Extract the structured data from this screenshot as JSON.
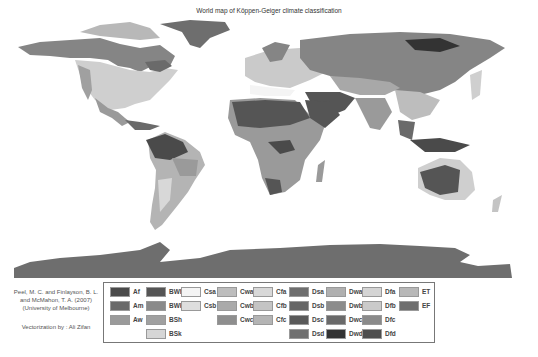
{
  "title": "World map of Köppen-Geiger climate classification",
  "credits": {
    "line1": "Peel, M. C. and Finlayson, B. L.",
    "line2": "and McMahon, T. A. (2007)",
    "line3": "(University of Melbourne)",
    "vectorization": "Vectorization by : Ali Zifan"
  },
  "legend": {
    "columns": [
      [
        {
          "code": "Af",
          "color": "#4a4a4a"
        },
        {
          "code": "Am",
          "color": "#6a6a6a"
        },
        {
          "code": "Aw",
          "color": "#9a9a9a"
        }
      ],
      [
        {
          "code": "BWh",
          "color": "#555555"
        },
        {
          "code": "BWk",
          "color": "#8a8a8a"
        },
        {
          "code": "BSh",
          "color": "#a0a0a0"
        },
        {
          "code": "BSk",
          "color": "#d6d6d6"
        }
      ],
      [
        {
          "code": "Csa",
          "color": "#f4f4f4"
        },
        {
          "code": "Csb",
          "color": "#dedede"
        }
      ],
      [
        {
          "code": "Cwa",
          "color": "#bdbdbd"
        },
        {
          "code": "Cwb",
          "color": "#aaaaaa"
        },
        {
          "code": "Cwc",
          "color": "#8e8e8e"
        }
      ],
      [
        {
          "code": "Cfa",
          "color": "#d8d8d8"
        },
        {
          "code": "Cfb",
          "color": "#c4c4c4"
        },
        {
          "code": "Cfc",
          "color": "#b4b4b4"
        }
      ],
      [
        {
          "code": "Dsa",
          "color": "#6e6e6e"
        },
        {
          "code": "Dsb",
          "color": "#666666"
        },
        {
          "code": "Dsc",
          "color": "#5a5a5a"
        },
        {
          "code": "Dsd",
          "color": "#707070"
        }
      ],
      [
        {
          "code": "Dwa",
          "color": "#b0b0b0"
        },
        {
          "code": "Dwb",
          "color": "#8c8c8c"
        },
        {
          "code": "Dwc",
          "color": "#6a6a6a"
        },
        {
          "code": "Dwd",
          "color": "#333333"
        }
      ],
      [
        {
          "code": "Dfa",
          "color": "#d4d4d4"
        },
        {
          "code": "Dfb",
          "color": "#cacaca"
        },
        {
          "code": "Dfc",
          "color": "#8a8a8a"
        },
        {
          "code": "Dfd",
          "color": "#4e4e4e"
        }
      ],
      [
        {
          "code": "ET",
          "color": "#b8b8b8"
        },
        {
          "code": "EF",
          "color": "#6e6e6e"
        }
      ]
    ]
  },
  "map_colors": {
    "ice": "#6e6e6e",
    "desert": "#555555",
    "tundra": "#8a8a8a",
    "temperate": "#cfcfcf",
    "tropical": "#4a4a4a",
    "savanna": "#9a9a9a",
    "steppe": "#a8a8a8",
    "boreal": "#858585"
  }
}
